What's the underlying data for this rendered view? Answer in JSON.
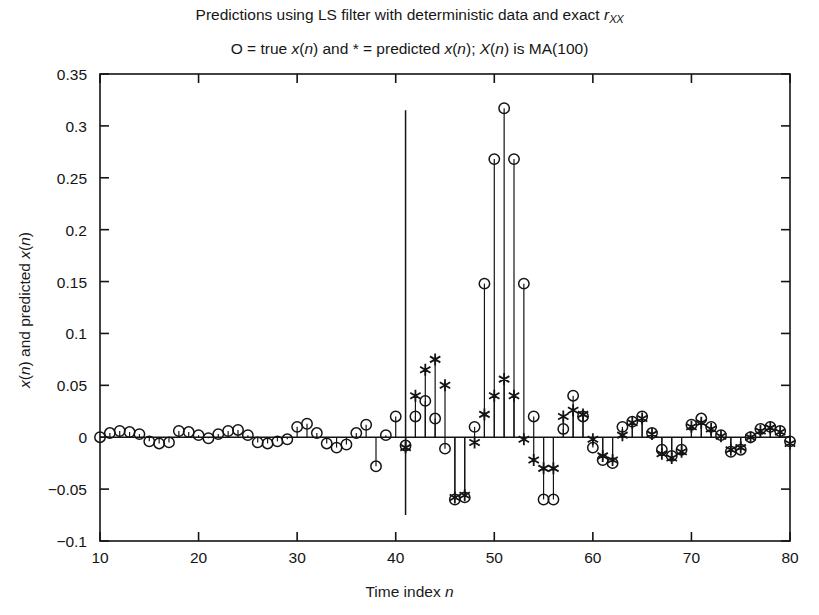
{
  "chart_data": {
    "type": "scatter",
    "title_parts": {
      "lead": "Predictions using LS filter with deterministic data and exact ",
      "symbol": "r",
      "symbol_sub": "XX"
    },
    "subtitle": "O = true x(n) and * = predicted x(n); X(n) is MA(100)",
    "subtitle_parts": {
      "p1": "O = true ",
      "x1": "x",
      "p2": "(",
      "n1": "n",
      "p3": ") and ",
      "star": "*",
      "p4": " = predicted ",
      "x2": "x",
      "p5": "(",
      "n2": "n",
      "p6": "); ",
      "bigx": "X",
      "p7": "(",
      "n3": "n",
      "p8": ") is MA(100)"
    },
    "xlabel": "Time index n",
    "xlabel_parts": {
      "text": "Time index ",
      "ital": "n"
    },
    "ylabel": "x(n) and predicted x(n)",
    "ylabel_parts": {
      "x1": "x",
      "p1": "(",
      "n1": "n",
      "p2": ") and predicted ",
      "x2": "x",
      "p3": "(",
      "n2": "n",
      "p4": ")"
    },
    "xlim": [
      10,
      80
    ],
    "ylim": [
      -0.1,
      0.35
    ],
    "xticks": [
      10,
      20,
      30,
      40,
      50,
      60,
      70,
      80
    ],
    "xtick_labels": [
      "10",
      "20",
      "30",
      "40",
      "50",
      "60",
      "70",
      "80"
    ],
    "yticks": [
      -0.1,
      -0.05,
      0,
      0.05,
      0.1,
      0.15,
      0.2,
      0.25,
      0.3,
      0.35
    ],
    "ytick_labels": [
      "-0.1",
      "-0.05",
      "0",
      "0.05",
      "0.1",
      "0.15",
      "0.2",
      "0.25",
      "0.3",
      "0.35"
    ],
    "grid": false,
    "legend_position": "none",
    "marker_colors": {
      "true_series": "#1a1a1a",
      "predicted_series": "#1a1a1a"
    },
    "divider_line": {
      "x": 41,
      "y_top": 0.315,
      "y_bottom": -0.075
    },
    "series": [
      {
        "name": "true x(n)",
        "marker": "o",
        "x": [
          10,
          11,
          12,
          13,
          14,
          15,
          16,
          17,
          18,
          19,
          20,
          21,
          22,
          23,
          24,
          25,
          26,
          27,
          28,
          29,
          30,
          31,
          32,
          33,
          34,
          35,
          36,
          37,
          38,
          39,
          40,
          41,
          42,
          43,
          44,
          45,
          46,
          47,
          48,
          49,
          50,
          51,
          52,
          53,
          54,
          55,
          56,
          57,
          58,
          59,
          60,
          61,
          62,
          63,
          64,
          65,
          66,
          67,
          68,
          69,
          70,
          71,
          72,
          73,
          74,
          75,
          76,
          77,
          78,
          79,
          80
        ],
        "values": [
          0.0,
          0.004,
          0.006,
          0.005,
          0.003,
          -0.004,
          -0.006,
          -0.005,
          0.006,
          0.005,
          0.002,
          -0.001,
          0.003,
          0.006,
          0.007,
          0.002,
          -0.005,
          -0.006,
          -0.004,
          -0.002,
          0.01,
          0.013,
          0.004,
          -0.006,
          -0.01,
          -0.007,
          0.004,
          0.012,
          -0.028,
          0.002,
          0.02,
          -0.008,
          0.02,
          0.035,
          0.018,
          -0.011,
          -0.06,
          -0.058,
          0.01,
          0.148,
          0.268,
          0.317,
          0.268,
          0.148,
          0.02,
          -0.06,
          -0.06,
          0.008,
          0.04,
          0.02,
          -0.01,
          -0.022,
          -0.025,
          0.01,
          0.015,
          0.02,
          0.004,
          -0.012,
          -0.018,
          -0.012,
          0.012,
          0.018,
          0.01,
          0.002,
          -0.014,
          -0.012,
          0.0,
          0.008,
          0.01,
          0.006,
          -0.004
        ]
      },
      {
        "name": "predicted x(n)",
        "marker": "*",
        "x": [
          41,
          42,
          43,
          44,
          45,
          46,
          47,
          48,
          49,
          50,
          51,
          52,
          53,
          54,
          55,
          56,
          57,
          58,
          59,
          60,
          61,
          62,
          63,
          64,
          65,
          66,
          67,
          68,
          69,
          70,
          71,
          72,
          73,
          74,
          75,
          76,
          77,
          78,
          79,
          80
        ],
        "values": [
          -0.01,
          0.04,
          0.065,
          0.075,
          0.05,
          -0.058,
          -0.056,
          -0.005,
          0.022,
          0.04,
          0.056,
          0.04,
          -0.002,
          -0.022,
          -0.03,
          -0.03,
          0.02,
          0.026,
          0.022,
          -0.002,
          -0.018,
          -0.022,
          0.002,
          0.014,
          0.018,
          0.003,
          -0.016,
          -0.02,
          -0.014,
          0.01,
          0.014,
          0.008,
          0.001,
          -0.012,
          -0.01,
          0.0,
          0.006,
          0.009,
          0.005,
          -0.006
        ]
      }
    ]
  }
}
